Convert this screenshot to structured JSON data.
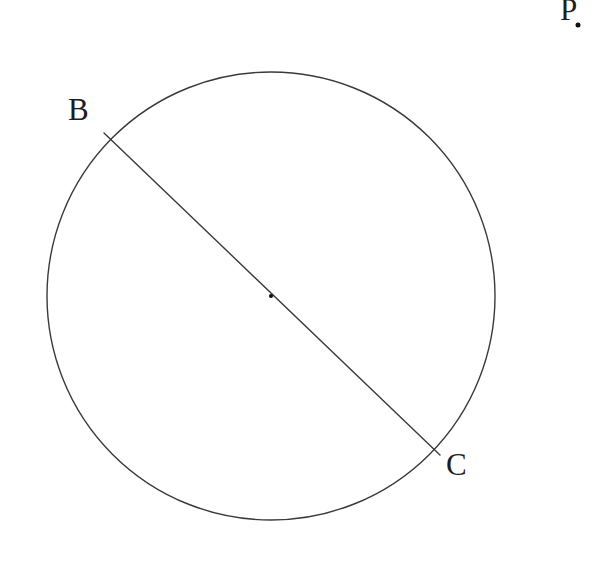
{
  "figure": {
    "background_color": "#ffffff",
    "stroke_color": "#3a3a3a",
    "label_color": "#1d1d1d",
    "width": 612,
    "height": 563,
    "labels": {
      "b": "B",
      "c": "C",
      "p": "P"
    },
    "circle": {
      "center_x": 271,
      "center_y": 296,
      "radius": 224,
      "stroke_width": 1.4
    },
    "diameter": {
      "x1": 104,
      "y1": 133,
      "x2": 440,
      "y2": 455,
      "stroke_width": 1.4
    },
    "center_point": {
      "x": 271,
      "y": 296,
      "size": 4.2
    },
    "external_point": {
      "x": 578,
      "y": 25,
      "size": 5
    }
  }
}
